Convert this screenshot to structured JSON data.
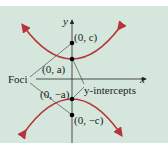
{
  "diagram": {
    "type": "hyperbola-vertical",
    "labels": {
      "y_axis": "y",
      "x_axis": "x",
      "foci": "Foci",
      "y_intercepts": "y-intercepts",
      "point_c": "(0, c)",
      "point_a": "(0, a)",
      "point_neg_a": "(0, −a)",
      "point_neg_c": "(0, −c)"
    },
    "colors": {
      "background": "#d5e7dd",
      "curve": "#b8343a",
      "axis": "#2a2a2a",
      "points": "#000000"
    }
  }
}
